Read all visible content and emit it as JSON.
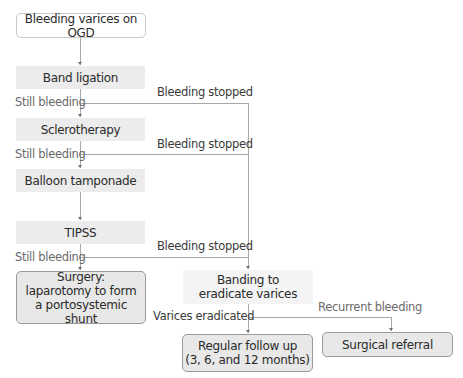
{
  "diagram": {
    "type": "flowchart",
    "nodes": {
      "start": "Bleeding varices on OGD",
      "band_ligation": "Band ligation",
      "sclerotherapy": "Sclerotherapy",
      "balloon": "Balloon tamponade",
      "tipss": "TIPSS",
      "surgery": "Surgery: laparotomy to form a portosystemic shunt",
      "banding": "Banding to eradicate varices",
      "follow_up_line1": "Regular follow up",
      "follow_up_line2": "(3, 6, and 12 months)",
      "surgical_referral": "Surgical referral"
    },
    "edge_labels": {
      "still_bleeding_1": "Still bleeding",
      "still_bleeding_2": "Still bleeding",
      "still_bleeding_3": "Still bleeding",
      "bleeding_stopped_1": "Bleeding stopped",
      "bleeding_stopped_2": "Bleeding stopped",
      "bleeding_stopped_3": "Bleeding stopped",
      "varices_eradicated": "Varices eradicated",
      "recurrent_bleeding": "Recurrent bleeding"
    },
    "edges": [
      {
        "from": "start",
        "to": "band_ligation"
      },
      {
        "from": "band_ligation",
        "to": "sclerotherapy",
        "label": "Still bleeding"
      },
      {
        "from": "band_ligation",
        "to": "banding",
        "label": "Bleeding stopped"
      },
      {
        "from": "sclerotherapy",
        "to": "balloon",
        "label": "Still bleeding"
      },
      {
        "from": "sclerotherapy",
        "to": "banding",
        "label": "Bleeding stopped"
      },
      {
        "from": "balloon",
        "to": "tipss"
      },
      {
        "from": "tipss",
        "to": "surgery",
        "label": "Still bleeding"
      },
      {
        "from": "tipss",
        "to": "banding",
        "label": "Bleeding stopped"
      },
      {
        "from": "banding",
        "to": "follow_up",
        "label": "Varices eradicated"
      },
      {
        "from": "banding",
        "to": "surgical_referral",
        "label": "Recurrent bleeding"
      }
    ]
  }
}
